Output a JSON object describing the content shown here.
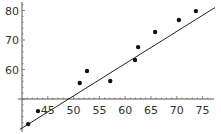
{
  "chart_data": {
    "type": "scatter",
    "title": "",
    "xlabel": "",
    "ylabel": "",
    "xlim": [
      40,
      77
    ],
    "ylim": [
      40,
      83
    ],
    "axes_origin": {
      "x": 40,
      "y": 50
    },
    "grid": false,
    "legend": null,
    "x_ticks": [
      45,
      50,
      55,
      60,
      65,
      70,
      75
    ],
    "y_ticks": [
      60,
      70,
      80
    ],
    "x_tick_labels": [
      "45",
      "50",
      "55",
      "60",
      "65",
      "70",
      "75"
    ],
    "y_tick_labels": [
      "60",
      "70",
      "80"
    ],
    "series": [
      {
        "name": "data",
        "kind": "points",
        "x": [
          41.2,
          43.1,
          51.2,
          52.6,
          57.1,
          61.9,
          62.5,
          65.8,
          70.4,
          73.7
        ],
        "y": [
          41.5,
          45.9,
          55.4,
          59.5,
          56.1,
          63.2,
          67.6,
          72.7,
          76.8,
          79.8
        ]
      },
      {
        "name": "fit",
        "kind": "line",
        "x": [
          39.6,
          77.4
        ],
        "y": [
          39.7,
          81.0
        ]
      }
    ],
    "colors": {
      "points": "#111111",
      "line": "#222222",
      "axes": "#555555"
    }
  }
}
